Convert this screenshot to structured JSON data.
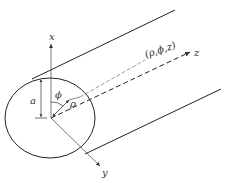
{
  "diagram": {
    "title": "",
    "labels": {
      "x_axis": "x",
      "y_axis": "y",
      "z_axis": "z",
      "radius_a": "a",
      "angle_phi": "ϕ",
      "radial_rho": "ρ",
      "point": "(ρ,ϕ,z)"
    },
    "colors": {
      "stroke": "#222222",
      "axis": "#555555",
      "background": "#ffffff"
    }
  }
}
